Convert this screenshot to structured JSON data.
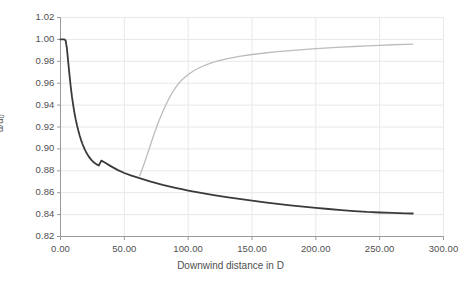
{
  "chart_data": {
    "type": "line",
    "title": "",
    "xlabel": "Downwind distance in D",
    "ylabel": "u/u0",
    "ylabel_base": "u/u",
    "ylabel_sub": "0",
    "xlim": [
      0,
      300
    ],
    "ylim": [
      0.82,
      1.02
    ],
    "grid": true,
    "legend": "none",
    "xticks": [
      0,
      50,
      100,
      150,
      200,
      250,
      300
    ],
    "xticklabels": [
      "0.00",
      "50.00",
      "100.00",
      "150.00",
      "200.00",
      "250.00",
      "300.00"
    ],
    "yticks": [
      0.82,
      0.84,
      0.86,
      0.88,
      0.9,
      0.92,
      0.94,
      0.96,
      0.98,
      1.0,
      1.02
    ],
    "yticklabels": [
      "0.82",
      "0.84",
      "0.86",
      "0.88",
      "0.90",
      "0.92",
      "0.94",
      "0.96",
      "0.98",
      "1.00",
      "1.02"
    ],
    "colors": {
      "series_deficit": "#3a3a3a",
      "series_recovery": "#bcbcbc",
      "grid": "#e8e8e8",
      "axis": "#9a9a9a",
      "text": "#4f4f4f",
      "background": "#ffffff"
    },
    "series": [
      {
        "name": "velocity-deficit-curve",
        "color": "#3a3a3a",
        "linewidth": 1.8,
        "points": [
          [
            0.0,
            1.0
          ],
          [
            1.5,
            1.0
          ],
          [
            3.0,
            1.0
          ],
          [
            4.0,
            0.999
          ],
          [
            5.0,
            0.992
          ],
          [
            6.0,
            0.98
          ],
          [
            7.0,
            0.968
          ],
          [
            8.0,
            0.957
          ],
          [
            9.0,
            0.9475
          ],
          [
            10.0,
            0.9395
          ],
          [
            11.0,
            0.9325
          ],
          [
            12.0,
            0.9265
          ],
          [
            13.0,
            0.9212
          ],
          [
            14.0,
            0.9165
          ],
          [
            15.0,
            0.9122
          ],
          [
            16.0,
            0.9085
          ],
          [
            17.0,
            0.9052
          ],
          [
            18.0,
            0.9022
          ],
          [
            19.0,
            0.8996
          ],
          [
            20.0,
            0.8972
          ],
          [
            22.0,
            0.8932
          ],
          [
            24.0,
            0.8902
          ],
          [
            26.0,
            0.8878
          ],
          [
            28.0,
            0.8861
          ],
          [
            30.0,
            0.8848
          ],
          [
            32.0,
            0.8893
          ],
          [
            34.0,
            0.888
          ],
          [
            36.0,
            0.8866
          ],
          [
            38.0,
            0.8852
          ],
          [
            40.0,
            0.8838
          ],
          [
            45.0,
            0.8806
          ],
          [
            50.0,
            0.878
          ],
          [
            55.0,
            0.8758
          ],
          [
            60.0,
            0.874
          ],
          [
            65.0,
            0.8722
          ],
          [
            70.0,
            0.8704
          ],
          [
            75.0,
            0.8688
          ],
          [
            80.0,
            0.8672
          ],
          [
            85.0,
            0.8658
          ],
          [
            90.0,
            0.8645
          ],
          [
            95.0,
            0.8632
          ],
          [
            100.0,
            0.862
          ],
          [
            110.0,
            0.8598
          ],
          [
            120.0,
            0.8578
          ],
          [
            130.0,
            0.856
          ],
          [
            140.0,
            0.8543
          ],
          [
            150.0,
            0.8527
          ],
          [
            160.0,
            0.8512
          ],
          [
            170.0,
            0.8498
          ],
          [
            180.0,
            0.8485
          ],
          [
            190.0,
            0.8473
          ],
          [
            200.0,
            0.8462
          ],
          [
            210.0,
            0.8451
          ],
          [
            220.0,
            0.8441
          ],
          [
            230.0,
            0.8432
          ],
          [
            240.0,
            0.8424
          ],
          [
            250.0,
            0.8419
          ],
          [
            260.0,
            0.8415
          ],
          [
            270.0,
            0.8412
          ],
          [
            276.0,
            0.841
          ]
        ]
      },
      {
        "name": "wake-recovery-curve",
        "color": "#bcbcbc",
        "linewidth": 1.3,
        "points": [
          [
            62.0,
            0.8755
          ],
          [
            64.0,
            0.8815
          ],
          [
            66.0,
            0.888
          ],
          [
            68.0,
            0.895
          ],
          [
            70.0,
            0.902
          ],
          [
            72.0,
            0.909
          ],
          [
            74.0,
            0.9158
          ],
          [
            76.0,
            0.9222
          ],
          [
            78.0,
            0.9282
          ],
          [
            80.0,
            0.9338
          ],
          [
            82.0,
            0.939
          ],
          [
            84.0,
            0.9438
          ],
          [
            86.0,
            0.9482
          ],
          [
            88.0,
            0.9522
          ],
          [
            90.0,
            0.9558
          ],
          [
            92.0,
            0.959
          ],
          [
            95.0,
            0.963
          ],
          [
            100.0,
            0.968
          ],
          [
            105.0,
            0.9718
          ],
          [
            110.0,
            0.9748
          ],
          [
            115.0,
            0.9772
          ],
          [
            120.0,
            0.9792
          ],
          [
            125.0,
            0.9808
          ],
          [
            130.0,
            0.9822
          ],
          [
            140.0,
            0.9844
          ],
          [
            150.0,
            0.9862
          ],
          [
            160.0,
            0.9876
          ],
          [
            170.0,
            0.9888
          ],
          [
            180.0,
            0.9898
          ],
          [
            190.0,
            0.9907
          ],
          [
            200.0,
            0.9915
          ],
          [
            210.0,
            0.9922
          ],
          [
            220.0,
            0.9929
          ],
          [
            230.0,
            0.9935
          ],
          [
            240.0,
            0.9941
          ],
          [
            250.0,
            0.9946
          ],
          [
            260.0,
            0.9951
          ],
          [
            270.0,
            0.9955
          ],
          [
            276.0,
            0.9957
          ]
        ]
      }
    ]
  }
}
